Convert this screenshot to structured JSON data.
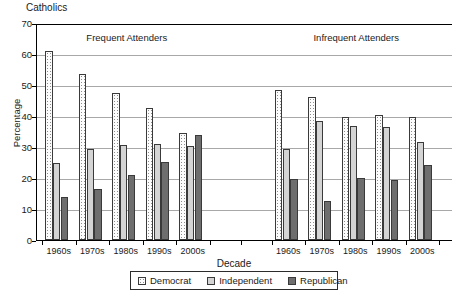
{
  "chart_data": {
    "type": "bar",
    "title": "Catholics",
    "xlabel": "Decade",
    "ylabel": "Percentage",
    "ylim": [
      0,
      70
    ],
    "ytick_step": 10,
    "yticks": [
      0,
      10,
      20,
      30,
      40,
      50,
      60,
      70
    ],
    "grid": true,
    "legend_position": "bottom",
    "panels": [
      {
        "caption": "Frequent Attenders",
        "categories": [
          "1960s",
          "1970s",
          "1980s",
          "1990s",
          "2000s"
        ],
        "series": [
          {
            "name": "Democrat",
            "values": [
              61.0,
              53.5,
              47.5,
              42.5,
              34.5
            ]
          },
          {
            "name": "Independent",
            "values": [
              25.0,
              29.3,
              30.5,
              31.0,
              30.2
            ]
          },
          {
            "name": "Republican",
            "values": [
              13.8,
              16.5,
              21.0,
              25.3,
              34.0
            ]
          }
        ]
      },
      {
        "caption": "Infrequent Attenders",
        "categories": [
          "1960s",
          "1970s",
          "1980s",
          "1990s",
          "2000s"
        ],
        "series": [
          {
            "name": "Democrat",
            "values": [
              48.3,
              46.0,
              39.7,
              40.3,
              39.7
            ]
          },
          {
            "name": "Independent",
            "values": [
              29.3,
              38.5,
              36.8,
              36.3,
              31.5
            ]
          },
          {
            "name": "Republican",
            "values": [
              19.8,
              12.5,
              20.0,
              19.5,
              24.3
            ]
          }
        ]
      }
    ],
    "legend": [
      {
        "label": "Democrat",
        "key": "democrat",
        "color": "#fcfcfc"
      },
      {
        "label": "Independent",
        "key": "independent",
        "color": "#d4d4d4"
      },
      {
        "label": "Republican",
        "key": "republican",
        "color": "#6e6e6e"
      }
    ]
  }
}
